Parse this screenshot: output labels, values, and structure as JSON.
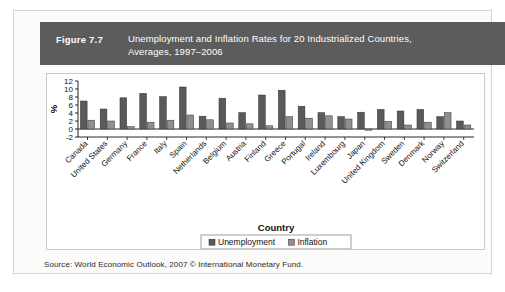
{
  "figure": {
    "number_label": "Figure 7.7",
    "title_line1": "Unemployment and Inflation Rates for 20 Industrialized Countries,",
    "title_line2": "Averages, 1997–2006",
    "band_color": "#5c5c5c"
  },
  "source_note": "Source: World Economic Outlook, 2007 © International Monetary Fund.",
  "chart_data": {
    "type": "bar",
    "title": "Unemployment and Inflation Rates for 20 Industrialized Countries, Averages, 1997–2006",
    "xlabel": "Country",
    "ylabel": "%",
    "ylim": [
      -2,
      12
    ],
    "yticks": [
      -2,
      0,
      2,
      4,
      6,
      8,
      10,
      12
    ],
    "ytick_labels": [
      "-2",
      "0",
      "2",
      "4",
      "6",
      "8",
      "10",
      "12"
    ],
    "grid": false,
    "legend_position": "bottom",
    "categories": [
      "Canada",
      "United States",
      "Germany",
      "France",
      "Italy",
      "Spain",
      "Netherlands",
      "Belgium",
      "Austria",
      "Finland",
      "Greece",
      "Portugal",
      "Ireland",
      "Luxembourg",
      "Japan",
      "United Kingdom",
      "Sweden",
      "Denmark",
      "Norway",
      "Switzerland"
    ],
    "series": [
      {
        "name": "Unemployment",
        "color": "#5a5a5a",
        "values": [
          7.0,
          5.0,
          7.8,
          8.9,
          8.1,
          10.5,
          3.2,
          7.7,
          4.1,
          8.5,
          9.7,
          5.7,
          4.1,
          3.1,
          4.2,
          4.9,
          4.5,
          4.9,
          3.1,
          2.0
        ]
      },
      {
        "name": "Inflation",
        "color": "#8f8f8f",
        "values": [
          2.2,
          2.0,
          0.6,
          1.7,
          2.2,
          3.5,
          2.3,
          1.5,
          1.3,
          0.8,
          3.1,
          2.7,
          3.3,
          2.5,
          -0.3,
          1.9,
          1.0,
          1.7,
          4.1,
          1.0
        ]
      }
    ]
  },
  "legend": {
    "items": [
      {
        "label": "Unemployment",
        "swatch": "#5a5a5a"
      },
      {
        "label": "Inflation",
        "swatch": "#8f8f8f"
      }
    ]
  }
}
